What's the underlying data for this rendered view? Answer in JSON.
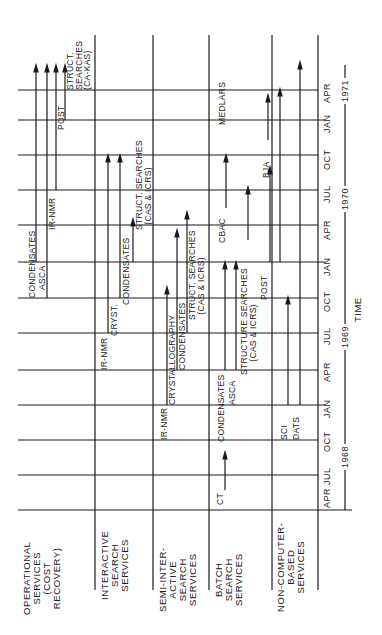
{
  "figure": {
    "orientation": "rotated 90 degrees counter-clockwise",
    "axis_label": "TIME",
    "rows": [
      {
        "id": "operational",
        "label": "OPERATIONAL\nSERVICES\n(COST\nRECOVERY)"
      },
      {
        "id": "interactive",
        "label": "INTERACTIVE\nSEARCH\nSERVICES"
      },
      {
        "id": "semi",
        "label": "SEMI-INTER-\nACTIVE\nSEARCH\nSERVICES"
      },
      {
        "id": "batch",
        "label": "BATCH\nSEARCH\nSERVICES"
      },
      {
        "id": "noncomputer",
        "label": "NON-COMPUTER-\nBASED\nSERVICES"
      }
    ],
    "months": [
      "APR",
      "JUL",
      "OCT",
      "JAN",
      "APR",
      "JUL",
      "OCT",
      "JAN",
      "APR",
      "JUL",
      "OCT",
      "JAN",
      "APR"
    ],
    "years": [
      "1968",
      "1969",
      "1970",
      "1971"
    ],
    "events": {
      "operational": [
        {
          "label": "CONDENSATES",
          "start": "1970-01"
        },
        {
          "label": "ASCA",
          "start": "1969-10"
        },
        {
          "label": "IR-NMR",
          "start": "1970-07"
        },
        {
          "label": "POST",
          "start": "1971-01"
        },
        {
          "label": "STRUCT. SEARCHES (CA-KAS)",
          "start": "1971-04"
        }
      ],
      "interactive": [
        {
          "label": "IR-NMR",
          "start": "1969-07"
        },
        {
          "label": "CRYST.",
          "start": "1969-10"
        },
        {
          "label": "CONDENSATES",
          "start": "1970-01"
        },
        {
          "label": "STRUCT. SEARCHES (CAS & ICRS)",
          "start": "1970-10"
        }
      ],
      "semi": [
        {
          "label": "IR-NMR",
          "start": "1969-01"
        },
        {
          "label": "CRYSTALLOGRAPHY",
          "start": "1969-04"
        },
        {
          "label": "CONDENSATES",
          "start": "1969-07"
        },
        {
          "label": "STRUCT. SEARCHES (CAS & ICRS)",
          "start": "1970-04"
        }
      ],
      "batch": [
        {
          "label": "CT",
          "start": "1968-04"
        },
        {
          "label": "CONDENSATES",
          "start": "1968-10"
        },
        {
          "label": "ASCA",
          "start": "1969-01"
        },
        {
          "label": "STRUCTURE SEARCHES (CAS & ICRS)",
          "start": "1969-04"
        },
        {
          "label": "CBAC",
          "start": "1970-01"
        },
        {
          "label": "MEDLARS",
          "start": "1971-01"
        }
      ],
      "noncomputer": [
        {
          "label": "SCI",
          "start": "1968-10"
        },
        {
          "label": "DATS",
          "start": "1968-10"
        },
        {
          "label": "POST",
          "start": "1970-01"
        },
        {
          "label": "BJA",
          "start": "1970-10"
        }
      ]
    }
  }
}
